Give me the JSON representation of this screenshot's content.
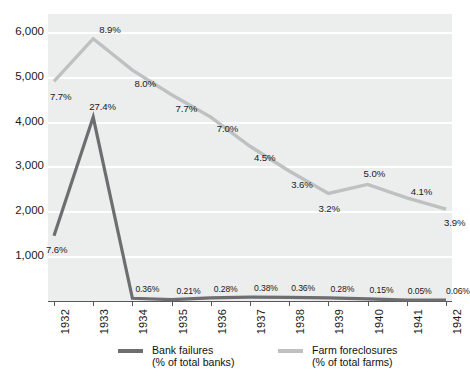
{
  "chart_data": {
    "type": "line",
    "title": "",
    "subtitle": "",
    "xlabel": "",
    "ylabel": "",
    "x": [
      "1932",
      "1933",
      "1934",
      "1935",
      "1936",
      "1937",
      "1938",
      "1939",
      "1940",
      "1941",
      "1942"
    ],
    "categories": [
      "1932",
      "1933",
      "1934",
      "1935",
      "1936",
      "1937",
      "1938",
      "1939",
      "1940",
      "1941",
      "1942"
    ],
    "ylim": [
      0,
      6400
    ],
    "y_ticks": [
      "1,000",
      "2,000",
      "3,000",
      "4,000",
      "5,000",
      "6,000"
    ],
    "y_tick_values": [
      1000,
      2000,
      3000,
      4000,
      5000,
      6000
    ],
    "grid": "horizontal",
    "legend_position": "bottom",
    "series": [
      {
        "name": "Bank failures",
        "sub": "(% of total banks)",
        "color": "#6e6e70",
        "values": [
          1456,
          4100,
          61,
          32,
          72,
          84,
          80,
          72,
          48,
          17,
          23
        ],
        "labels": [
          "7.6%",
          "27.4%",
          "0.36%",
          "0.21%",
          "0.28%",
          "0.38%",
          "0.36%",
          "0.28%",
          "0.15%",
          "0.05%",
          "0.06%"
        ]
      },
      {
        "name": "Farm foreclosures",
        "sub": "(% of total farms)",
        "color": "#bfc0c1",
        "values": [
          4900,
          5850,
          5150,
          4600,
          4100,
          3450,
          2900,
          2400,
          2600,
          2300,
          2050
        ],
        "labels": [
          "7.7%",
          "8.9%",
          "8.0%",
          "7.7%",
          "7.0%",
          "4.5%",
          "3.6%",
          "3.2%",
          "5.0%",
          "4.1%",
          "3.9%"
        ]
      }
    ]
  },
  "legend": {
    "entries": [
      {
        "label": "Bank failures",
        "sub": "(% of total banks)",
        "color": "#6e6e70"
      },
      {
        "label": "Farm foreclosures",
        "sub": "(% of total farms)",
        "color": "#bfc0c1"
      }
    ]
  },
  "colors": {
    "plot_background": "#eceded",
    "gridline": "#ffffff",
    "axis": "#58585a",
    "bank_failures": "#6e6e70",
    "farm_foreclosures": "#bfc0c1",
    "text": "#1a1a1a"
  }
}
